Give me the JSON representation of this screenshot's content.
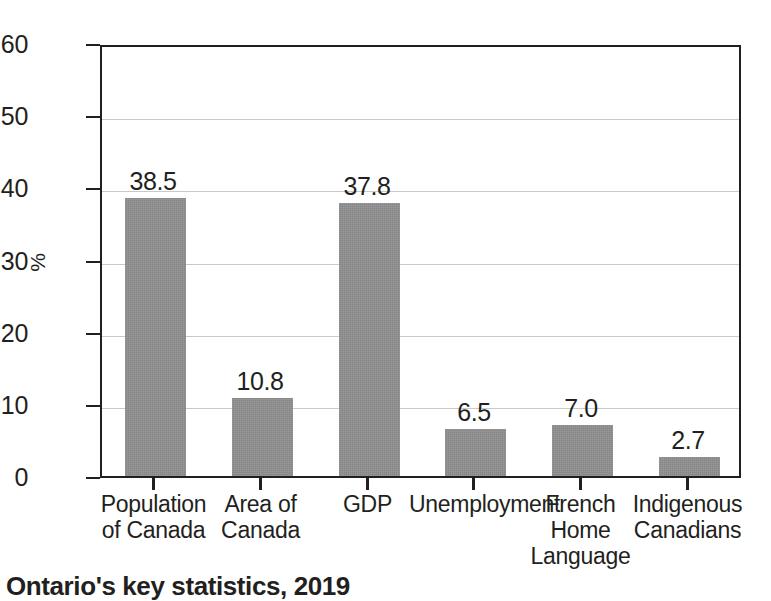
{
  "caption": "Ontario's key statistics, 2019",
  "chart_data": {
    "type": "bar",
    "title": "Ontario's key statistics, 2019",
    "xlabel": "",
    "ylabel": "%",
    "ylim": [
      0,
      60
    ],
    "ytick_step": 10,
    "yticks": [
      "0",
      "10",
      "20",
      "30",
      "40",
      "50",
      "60"
    ],
    "grid": true,
    "legend": false,
    "bar_color": "#8d8d8d",
    "axis_color": "#231f20",
    "gridline_color": "#c9c9c9",
    "background": "#ffffff",
    "data_labels": true,
    "categories": [
      "Population\nof Canada",
      "Area of\nCanada",
      "GDP",
      "Unemployment",
      "French\nHome\nLanguage",
      "Indigenous\nCanadians"
    ],
    "values": [
      38.5,
      10.8,
      37.8,
      6.5,
      7.0,
      2.7
    ],
    "value_labels": [
      "38.5",
      "10.8",
      "37.8",
      "6.5",
      "7.0",
      "2.7"
    ]
  }
}
